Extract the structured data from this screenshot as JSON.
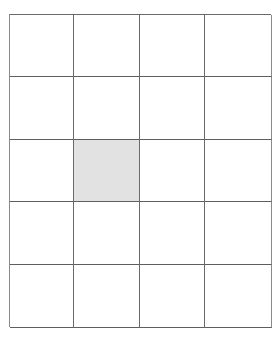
{
  "grid": {
    "rows": 5,
    "columns": 4,
    "line_color": "#5e5e5e",
    "cell_fill": "#ffffff",
    "shaded_fill": "#e2e2e2",
    "shaded_cells": [
      {
        "row": 3,
        "column": 2
      }
    ],
    "cells": [
      [
        "",
        "",
        "",
        ""
      ],
      [
        "",
        "",
        "",
        ""
      ],
      [
        "",
        "shaded",
        "",
        ""
      ],
      [
        "",
        "",
        "",
        ""
      ],
      [
        "",
        "",
        "",
        ""
      ]
    ]
  }
}
